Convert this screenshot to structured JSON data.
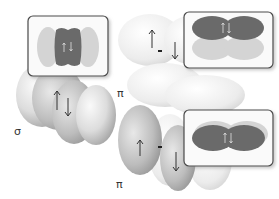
{
  "diagram": {
    "labels": {
      "sigma": "σ",
      "pi_upper": "π",
      "pi_lower": "π"
    },
    "spin_symbols": {
      "up": "↑",
      "down": "↓",
      "pair": "↑↓"
    },
    "insets": [
      {
        "id": "sigma-inset",
        "description": "sigma MO: dark central lobe flanked by light lobes"
      },
      {
        "id": "pi-upper-inset",
        "description": "pi MO: dark upper lobes over light lower lobes"
      },
      {
        "id": "pi-lower-inset",
        "description": "pi MO: dark merged lobes"
      }
    ],
    "colors": {
      "dark_lobe": "#6b6b6b",
      "light_lobe": "#d4d4d4",
      "inset_border": "#555555",
      "orbital_light": "#eeeeee",
      "orbital_mid": "#bdbdbd"
    }
  }
}
